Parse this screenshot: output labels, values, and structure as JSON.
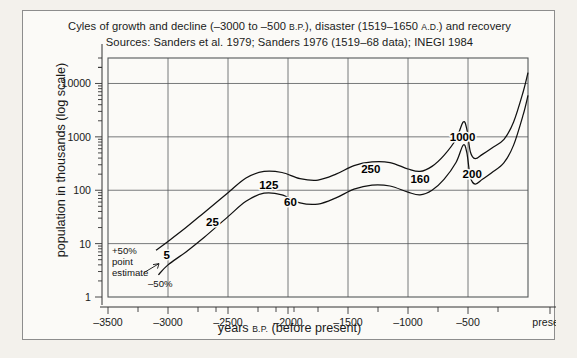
{
  "figure": {
    "title_line1_parts": [
      "Cyles of growth and decline (–3000 to –500 ",
      "B.P.",
      "), disaster (1519–1650 ",
      "A.D.",
      ") and recovery"
    ],
    "title_line1_a": "Cyles of growth and decline (–3000 to –500 ",
    "title_line1_sc1": "B.P.",
    "title_line1_b": "), disaster (1519–1650 ",
    "title_line1_sc2": "A.D.",
    "title_line1_c": ") and recovery",
    "title_line2": "Sources: Sanders et al. 1979; Sanders 1976 (1519–68 data); INEGI 1984",
    "ylabel": "population in thousands (log scale)",
    "xlabel_a": "years ",
    "xlabel_sc": "B.P.",
    "xlabel_b": " (before present)"
  },
  "annotations": {
    "upper_band": "+50%",
    "point_estimate_line1": "point",
    "point_estimate_line2": "estimate",
    "lower_band": "–50%"
  },
  "chart_data": {
    "type": "line",
    "title": "Cyles of growth and decline (–3000 to –500 B.P.), disaster (1519–1650 A.D.) and recovery",
    "subtitle": "Sources: Sanders et al. 1979; Sanders 1976 (1519–68 data); INEGI 1984",
    "xlabel": "years B.P. (before present)",
    "ylabel": "population in thousands (log scale)",
    "yscale": "log",
    "ylim": [
      1,
      30000
    ],
    "xlim": [
      -3500,
      0
    ],
    "grid": true,
    "legend": "none",
    "y_ticks": [
      1,
      10,
      100,
      1000,
      10000
    ],
    "y_tick_labels": [
      "1",
      "10",
      "100",
      "1000",
      "10000"
    ],
    "x_ticks": [
      -3500,
      -3000,
      -2500,
      -2000,
      -1500,
      -1000,
      -500,
      0
    ],
    "x_tick_labels": [
      "–3500",
      "–3000",
      "–2500",
      "–2000",
      "–1500",
      "–1000",
      "–500",
      "present"
    ],
    "x_minor_ticks": [
      -3250,
      -2750,
      -2600,
      -2250,
      -2100,
      -1950,
      -1750,
      -1250,
      -750,
      -250
    ],
    "series": [
      {
        "name": "+50% band (upper estimate)",
        "points": [
          [
            -3100,
            7.5
          ],
          [
            -3000,
            11
          ],
          [
            -2850,
            20
          ],
          [
            -2700,
            38
          ],
          [
            -2500,
            90
          ],
          [
            -2350,
            170
          ],
          [
            -2200,
            225
          ],
          [
            -2050,
            215
          ],
          [
            -1900,
            165
          ],
          [
            -1750,
            155
          ],
          [
            -1600,
            200
          ],
          [
            -1450,
            290
          ],
          [
            -1300,
            340
          ],
          [
            -1150,
            330
          ],
          [
            -1000,
            250
          ],
          [
            -900,
            225
          ],
          [
            -800,
            280
          ],
          [
            -700,
            450
          ],
          [
            -600,
            900
          ],
          [
            -540,
            1900
          ],
          [
            -510,
            1400
          ],
          [
            -480,
            520
          ],
          [
            -440,
            390
          ],
          [
            -380,
            470
          ],
          [
            -300,
            620
          ],
          [
            -200,
            900
          ],
          [
            -120,
            1900
          ],
          [
            -40,
            7000
          ],
          [
            0,
            16000
          ]
        ]
      },
      {
        "name": "–50% band (lower estimate)",
        "points": [
          [
            -3080,
            2.6
          ],
          [
            -3000,
            4
          ],
          [
            -2850,
            7
          ],
          [
            -2700,
            13
          ],
          [
            -2500,
            32
          ],
          [
            -2350,
            62
          ],
          [
            -2200,
            88
          ],
          [
            -2050,
            82
          ],
          [
            -1900,
            58
          ],
          [
            -1750,
            55
          ],
          [
            -1600,
            72
          ],
          [
            -1450,
            105
          ],
          [
            -1300,
            125
          ],
          [
            -1150,
            120
          ],
          [
            -1000,
            92
          ],
          [
            -900,
            82
          ],
          [
            -800,
            100
          ],
          [
            -700,
            160
          ],
          [
            -600,
            330
          ],
          [
            -540,
            700
          ],
          [
            -510,
            510
          ],
          [
            -480,
            175
          ],
          [
            -440,
            130
          ],
          [
            -380,
            160
          ],
          [
            -300,
            215
          ],
          [
            -200,
            330
          ],
          [
            -120,
            700
          ],
          [
            -40,
            2600
          ],
          [
            0,
            6000
          ]
        ]
      }
    ],
    "data_labels": [
      {
        "text": "5",
        "x": -3010,
        "y": 6.0
      },
      {
        "text": "25",
        "x": -2630,
        "y": 25
      },
      {
        "text": "125",
        "x": -2160,
        "y": 125
      },
      {
        "text": "60",
        "x": -1980,
        "y": 60
      },
      {
        "text": "250",
        "x": -1310,
        "y": 250
      },
      {
        "text": "160",
        "x": -900,
        "y": 160
      },
      {
        "text": "1000",
        "x": -545,
        "y": 1000
      },
      {
        "text": "200",
        "x": -465,
        "y": 200
      }
    ]
  }
}
